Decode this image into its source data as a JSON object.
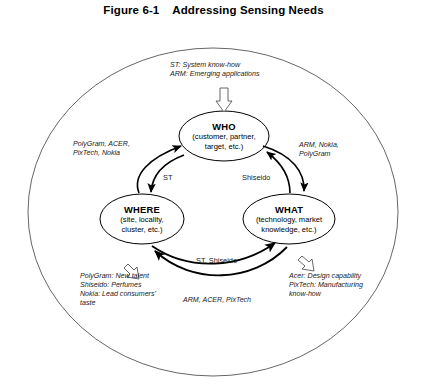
{
  "figure": {
    "number": "Figure 6-1",
    "title": "Addressing Sensing Needs"
  },
  "nodes": {
    "who": {
      "label": "WHO",
      "detail_line1": "(customer, partner,",
      "detail_line2": "target, etc.)"
    },
    "where": {
      "label": "WHERE",
      "detail_line1": "(site, locality,",
      "detail_line2": "cluster, etc.)"
    },
    "what": {
      "label": "WHAT",
      "detail_line1": "(technology, market",
      "detail_line2": "knowledge, etc.)"
    }
  },
  "edge_labels": {
    "who_where": "ST",
    "who_what": "Shiseido",
    "where_what_upper": "ST, Shiseido",
    "where_what_lower": "ARM, ACER, PixTech"
  },
  "annotations": {
    "top": {
      "line1": "ST: System know-how",
      "line2": "ARM: Emerging applications"
    },
    "left": {
      "line1": "PolyGram, ACER,",
      "line2": "PixTech, Nokia"
    },
    "right": {
      "line1": "ARM, Nokia,",
      "line2": "PolyGram"
    },
    "bottom_left": {
      "line1": "PolyGram: New talent",
      "line2": "Shiseido: Perfumes",
      "line3": "Nokia: Lead consumers'",
      "line4": "taste"
    },
    "bottom_right": {
      "line1": "Acer: Design capability",
      "line2": "PixTech: Manufacturing",
      "line3": "know-how"
    }
  },
  "colors": {
    "stroke": "#000000",
    "outer_stroke": "#4d4d4d",
    "background": "#ffffff",
    "text": "#000000"
  }
}
